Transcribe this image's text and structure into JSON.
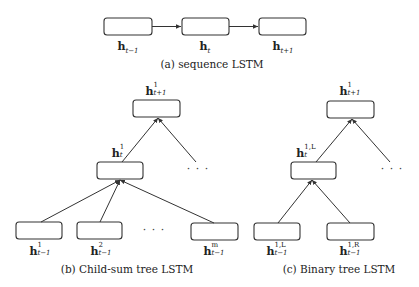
{
  "panels": {
    "sequence": {
      "caption": "(a) sequence LSTM",
      "nodes": [
        {
          "base": "h",
          "sub": "t−1",
          "sup": ""
        },
        {
          "base": "h",
          "sub": "t",
          "sup": ""
        },
        {
          "base": "h",
          "sub": "t+1",
          "sup": ""
        }
      ]
    },
    "child_sum": {
      "caption": "(b) Child-sum tree LSTM",
      "root": {
        "base": "h",
        "sup": "1",
        "sub": "t+1"
      },
      "middle": {
        "base": "h",
        "sup": "1",
        "sub": "t"
      },
      "children": [
        {
          "base": "h",
          "sup": "1",
          "sub": "t−1"
        },
        {
          "base": "h",
          "sup": "2",
          "sub": "t−1"
        },
        {
          "base": "h",
          "sup": "m",
          "sub": "t−1"
        }
      ],
      "ellipsis": "· · ·"
    },
    "binary": {
      "caption": "(c) Binary tree LSTM",
      "root": {
        "base": "h",
        "sup": "1",
        "sub": "t+1"
      },
      "middle": {
        "base": "h",
        "sup": "1,L",
        "sub": "t"
      },
      "children": [
        {
          "base": "h",
          "sup": "1,L",
          "sub": "t−1"
        },
        {
          "base": "h",
          "sup": "1,R",
          "sub": "t−1"
        }
      ],
      "ellipsis": "· · ·"
    }
  }
}
